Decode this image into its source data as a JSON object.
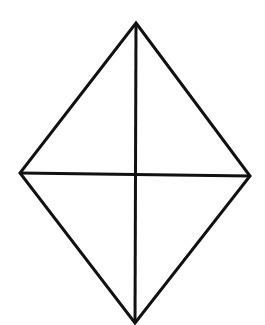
{
  "diagram": {
    "type": "rhombus-with-diagonals",
    "width": 265,
    "height": 325,
    "background": "#ffffff",
    "stroke_color": "#111111",
    "stroke_width": 3,
    "vertices": {
      "top": [
        136,
        23
      ],
      "right": [
        250,
        176
      ],
      "bottom": [
        135,
        323
      ],
      "left": [
        20,
        173
      ]
    },
    "diagonals": [
      {
        "name": "vertical",
        "from": [
          136,
          23
        ],
        "to": [
          135,
          323
        ]
      },
      {
        "name": "horizontal",
        "from": [
          20,
          173
        ],
        "to": [
          250,
          176
        ]
      }
    ]
  }
}
